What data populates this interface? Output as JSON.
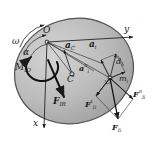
{
  "figure": {
    "body_shape": "ellipse-disk",
    "colors": {
      "disk_fill": "#b9b9b9",
      "disk_edge": "#4a4a4a",
      "line": "#1b1b1b",
      "label": "#1b1b1b",
      "background": "#ffffff"
    }
  },
  "axes": {
    "y": {
      "label": "y",
      "direction": "right",
      "origin": "O"
    },
    "x": {
      "label": "x",
      "direction": "down",
      "origin": "O"
    }
  },
  "points": [
    {
      "name": "O",
      "label": "O",
      "role": "rotation-center"
    },
    {
      "name": "C",
      "label": "C",
      "role": "center-of-mass"
    },
    {
      "name": "mi",
      "label": "m",
      "sub": "i",
      "role": "elementary-mass"
    }
  ],
  "kinematics": [
    {
      "name": "omega",
      "label": "ω",
      "role": "angular-velocity-arc"
    },
    {
      "name": "alpha",
      "label": "α",
      "role": "angular-acceleration-arc"
    }
  ],
  "moment": {
    "name": "M_IO",
    "base": "M",
    "sub": "IO",
    "role": "inertia-moment"
  },
  "accelerations": [
    {
      "name": "a_C",
      "base": "a",
      "sub": "C",
      "sup": "",
      "role": "mass-center-acceleration"
    },
    {
      "name": "a_i",
      "base": "a",
      "sub": "i",
      "sup": "",
      "role": "total-acceleration"
    },
    {
      "name": "a_i_t",
      "base": "a",
      "sub": "i",
      "sup": "t",
      "role": "tangential-acceleration"
    },
    {
      "name": "a_i_n",
      "base": "a",
      "sub": "i",
      "sup": "n",
      "role": "normal-acceleration"
    }
  ],
  "distances": [
    {
      "name": "d_i",
      "base": "d",
      "sub": "i",
      "role": "radius-to-element"
    }
  ],
  "forces": [
    {
      "name": "F_IR",
      "base": "F",
      "sub": "IR",
      "sup": "",
      "role": "resultant-inertia-force"
    },
    {
      "name": "F_Ii",
      "base": "F",
      "sub": "Ii",
      "sup": "",
      "role": "elementary-inertia-force"
    },
    {
      "name": "F_Ii_n",
      "base": "F",
      "sub": "Ii",
      "sup": "n",
      "role": "normal-inertia-force"
    },
    {
      "name": "F_Ii_t",
      "base": "F",
      "sub": "Ii",
      "sup": "t",
      "role": "tangential-inertia-force"
    }
  ]
}
